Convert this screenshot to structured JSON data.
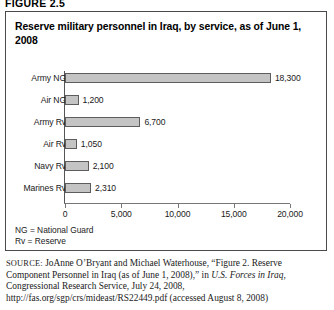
{
  "figure": {
    "number_label": "FIGURE 2.5"
  },
  "chart_title": "Reserve military personnel in Iraq, by service, as of June 1, 2008",
  "key": {
    "line1": "NG = National Guard",
    "line2": "Rv = Reserve"
  },
  "source": {
    "label": "SOURCE:",
    "text_part1": " JoAnne O’Bryant and Michael Waterhouse, “Figure 2. Reserve Component Personnel in Iraq (as of June 1, 2008),” in ",
    "italic1": "U.S. Forces in Iraq,",
    "text_part2": " Congressional Research Service, July 24, 2008, http://fas.org/sgp/crs/mideast/RS22449.pdf (accessed August 8, 2008)"
  },
  "chart_data": {
    "type": "bar",
    "orientation": "horizontal",
    "title": "Reserve military personnel in Iraq, by service, as of June 1, 2008",
    "xlabel": "",
    "ylabel": "",
    "xlim": [
      0,
      20000
    ],
    "grid": false,
    "legend": "none",
    "categories": [
      "Army NG",
      "Air NG",
      "Army Rv",
      "Air Rv",
      "Navy Rv",
      "Marines Rv"
    ],
    "values": [
      18300,
      1200,
      6700,
      1050,
      2100,
      2310
    ],
    "value_labels": [
      "18,300",
      "1,200",
      "6,700",
      "1,050",
      "2,100",
      "2,310"
    ],
    "xticks": [
      0,
      5000,
      10000,
      15000,
      20000
    ],
    "xtick_labels": [
      "0",
      "5,000",
      "10,000",
      "15,000",
      "20,000"
    ],
    "bar_fill_color": "#c4c4c4",
    "bar_edge_color": "#5d5d5d"
  }
}
